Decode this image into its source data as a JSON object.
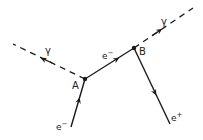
{
  "diagram": {
    "type": "feynman-diagram",
    "vertices": [
      {
        "id": "A",
        "label": "A",
        "x": 85,
        "y": 79
      },
      {
        "id": "B",
        "label": "B",
        "x": 134,
        "y": 48
      }
    ],
    "lines": [
      {
        "id": "incoming-electron",
        "kind": "fermion",
        "label": "e",
        "charge": "-",
        "from": [
          71,
          127
        ],
        "to": [
          85,
          79
        ],
        "arrow": "toward-A"
      },
      {
        "id": "photon-left",
        "kind": "photon-dashed",
        "label": "γ",
        "from": [
          85,
          79
        ],
        "to": [
          13,
          44
        ],
        "arrow": "away-from-A"
      },
      {
        "id": "internal-electron",
        "kind": "fermion",
        "label": "e",
        "charge": "-",
        "from": [
          85,
          79
        ],
        "to": [
          134,
          48
        ],
        "arrow": "toward-B"
      },
      {
        "id": "photon-right",
        "kind": "photon-dashed",
        "label": "γ",
        "from": [
          134,
          48
        ],
        "to": [
          193,
          8
        ],
        "arrow": "away-from-B"
      },
      {
        "id": "outgoing-positron",
        "kind": "fermion",
        "label": "e",
        "charge": "+",
        "from": [
          134,
          48
        ],
        "to": [
          170,
          124
        ],
        "arrow": "away-from-B"
      }
    ],
    "labels": {
      "vertex_a": "A",
      "vertex_b": "B",
      "gamma_left": "γ",
      "gamma_right": "γ",
      "electron_in_base": "e",
      "electron_in_sup": "−",
      "electron_mid_base": "e",
      "electron_mid_sup": "−",
      "positron_base": "e",
      "positron_sup": "+"
    },
    "colors": {
      "line": "#1a1a1a",
      "background": "#ffffff"
    }
  }
}
